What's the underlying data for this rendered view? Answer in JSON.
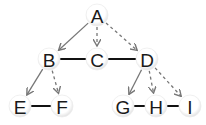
{
  "diagram": {
    "type": "tree-graph",
    "colors": {
      "node_fill": "#ffffff",
      "node_shadow": "#dcdcdc",
      "label": "#1a1a1a",
      "arrow": "#777777",
      "link": "#111111"
    },
    "nodes": [
      {
        "id": "A",
        "label": "A",
        "x": 97,
        "y": 15
      },
      {
        "id": "B",
        "label": "B",
        "x": 49,
        "y": 59
      },
      {
        "id": "C",
        "label": "C",
        "x": 97,
        "y": 59
      },
      {
        "id": "D",
        "label": "D",
        "x": 147,
        "y": 59
      },
      {
        "id": "E",
        "label": "E",
        "x": 20,
        "y": 106
      },
      {
        "id": "F",
        "label": "F",
        "x": 62,
        "y": 106
      },
      {
        "id": "G",
        "label": "G",
        "x": 123,
        "y": 106
      },
      {
        "id": "H",
        "label": "H",
        "x": 156,
        "y": 106
      },
      {
        "id": "I",
        "label": "I",
        "x": 190,
        "y": 106
      }
    ],
    "edges": [
      {
        "from": "A",
        "to": "B",
        "style": "solid-arrow"
      },
      {
        "from": "A",
        "to": "C",
        "style": "dashed-arrow"
      },
      {
        "from": "A",
        "to": "D",
        "style": "dashed-arrow"
      },
      {
        "from": "B",
        "to": "C",
        "style": "thick-line"
      },
      {
        "from": "C",
        "to": "D",
        "style": "thick-line"
      },
      {
        "from": "B",
        "to": "E",
        "style": "solid-arrow"
      },
      {
        "from": "B",
        "to": "F",
        "style": "dashed-arrow"
      },
      {
        "from": "E",
        "to": "F",
        "style": "thick-line"
      },
      {
        "from": "D",
        "to": "G",
        "style": "solid-arrow"
      },
      {
        "from": "D",
        "to": "H",
        "style": "dashed-arrow"
      },
      {
        "from": "D",
        "to": "I",
        "style": "dashed-arrow"
      },
      {
        "from": "G",
        "to": "H",
        "style": "thick-line"
      },
      {
        "from": "H",
        "to": "I",
        "style": "thick-line"
      }
    ]
  }
}
